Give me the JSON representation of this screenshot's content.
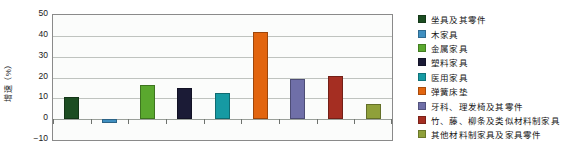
{
  "chart_data": {
    "type": "bar",
    "title": "",
    "xlabel": "",
    "ylabel": "增速（%）",
    "ylim": [
      -10,
      50
    ],
    "yticks": [
      50,
      40,
      30,
      20,
      10,
      0,
      -10
    ],
    "grid": true,
    "legend_position": "right",
    "categories": [
      "坐具及其零件",
      "木家具",
      "金属家具",
      "塑料家具",
      "医用家具",
      "弹簧床垫",
      "牙科、理发椅及其零件",
      "竹、藤、柳条及类似材料制家具",
      "其他材料制家具及家具零件"
    ],
    "values": [
      10.5,
      -2.0,
      16.5,
      15.0,
      12.5,
      42.0,
      19.5,
      20.5,
      7.5
    ],
    "colors": [
      "#1c4d22",
      "#3f8fc0",
      "#5aa82e",
      "#1b1b36",
      "#169aa3",
      "#e2650f",
      "#6f6fa8",
      "#a52e22",
      "#8fa03a"
    ]
  },
  "legend": {
    "items": [
      {
        "label": "坐具及其零件",
        "color": "#1c4d22"
      },
      {
        "label": "木家具",
        "color": "#3f8fc0"
      },
      {
        "label": "金属家具",
        "color": "#5aa82e"
      },
      {
        "label": "塑料家具",
        "color": "#1b1b36"
      },
      {
        "label": "医用家具",
        "color": "#169aa3"
      },
      {
        "label": "弹簧床垫",
        "color": "#e2650f"
      },
      {
        "label": "牙科、理发椅及其零件",
        "color": "#6f6fa8"
      },
      {
        "label": "竹、藤、柳条及类似材料制家具",
        "color": "#a52e22"
      },
      {
        "label": "其他材料制家具及家具零件",
        "color": "#8fa03a"
      }
    ]
  }
}
